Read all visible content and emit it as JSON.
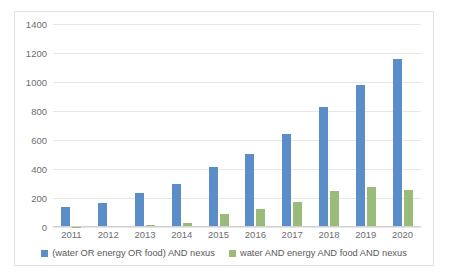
{
  "chart_data": {
    "type": "bar",
    "title": "",
    "xlabel": "",
    "ylabel": "",
    "categories": [
      "2011",
      "2012",
      "2013",
      "2014",
      "2015",
      "2016",
      "2017",
      "2018",
      "2019",
      "2020"
    ],
    "series": [
      {
        "name": "(water OR energy OR food) AND nexus",
        "color": "#5b8dc8",
        "values": [
          140,
          165,
          237,
          297,
          415,
          505,
          640,
          825,
          980,
          1160
        ]
      },
      {
        "name": "water  AND  energy  AND  food  AND  nexus",
        "color": "#9bbb7a",
        "values": [
          2,
          5,
          14,
          28,
          90,
          125,
          170,
          248,
          278,
          255
        ]
      }
    ],
    "ylim": [
      0,
      1400
    ],
    "yticks": [
      0,
      200,
      400,
      600,
      800,
      1000,
      1200,
      1400
    ],
    "ytick_labels": [
      "0",
      "200",
      "400",
      "600",
      "800",
      "1000",
      "1200",
      "1400"
    ],
    "grid": true,
    "legend_position": "bottom"
  },
  "legend": {
    "items": [
      {
        "label": "(water OR energy OR food) AND nexus"
      },
      {
        "label": "water  AND  energy  AND  food  AND  nexus"
      }
    ]
  }
}
